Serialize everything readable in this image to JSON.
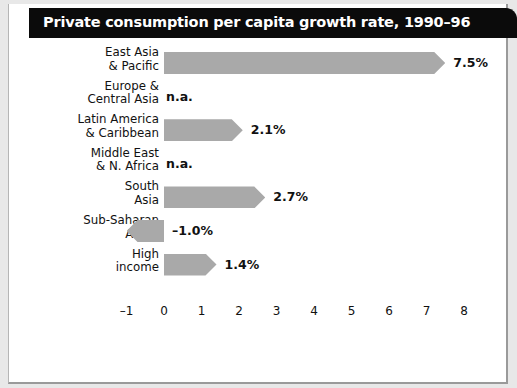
{
  "header": {
    "title": "Private consumption per capita growth rate, 1990–96"
  },
  "chart_data": {
    "type": "bar",
    "orientation": "horizontal",
    "title": "Private consumption per capita growth rate, 1990–96",
    "xlabel": "",
    "ylabel": "",
    "xlim": [
      -1,
      8
    ],
    "xticks": [
      "–1",
      "0",
      "1",
      "2",
      "3",
      "4",
      "5",
      "6",
      "7",
      "8"
    ],
    "xtick_values": [
      -1,
      0,
      1,
      2,
      3,
      4,
      5,
      6,
      7,
      8
    ],
    "grid": false,
    "legend": "none",
    "bar_color": "#a9a9a9",
    "categories": [
      {
        "line1": "East Asia",
        "line2": "& Pacific"
      },
      {
        "line1": "Europe &",
        "line2": "Central Asia"
      },
      {
        "line1": "Latin America",
        "line2": "& Caribbean"
      },
      {
        "line1": "Middle East",
        "line2": "& N. Africa"
      },
      {
        "line1": "South",
        "line2": "Asia"
      },
      {
        "line1": "Sub-Saharan",
        "line2": "Africa"
      },
      {
        "line1": "High",
        "line2": "income"
      }
    ],
    "values": [
      7.5,
      null,
      2.1,
      null,
      2.7,
      -1.0,
      1.4
    ],
    "labels": [
      "7.5%",
      "n.a.",
      "2.1%",
      "n.a.",
      "2.7%",
      "–1.0%",
      "1.4%"
    ],
    "na_text": "n.a."
  }
}
